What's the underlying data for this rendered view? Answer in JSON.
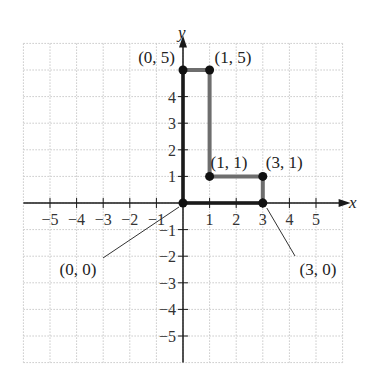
{
  "chart_data": {
    "type": "line",
    "title": "",
    "xlabel": "x",
    "ylabel": "y",
    "xlim": [
      -6,
      6
    ],
    "ylim": [
      -6,
      6
    ],
    "grid": true,
    "x_ticks": [
      -5,
      -4,
      -3,
      -2,
      -1,
      1,
      2,
      3,
      4,
      5
    ],
    "y_ticks": [
      -5,
      -4,
      -3,
      -2,
      -1,
      1,
      2,
      3,
      4
    ],
    "x_tick_labels": [
      "−5",
      "−4",
      "−3",
      "−2",
      "−1",
      "1",
      "2",
      "3",
      "4",
      "5"
    ],
    "y_tick_labels": [
      "−5",
      "−4",
      "−3",
      "−2",
      "−1",
      "1",
      "2",
      "3",
      "4"
    ],
    "series": [
      {
        "name": "L-shaped polygon",
        "x": [
          0,
          1,
          1,
          3,
          3,
          0,
          0
        ],
        "y": [
          5,
          5,
          1,
          1,
          0,
          0,
          5
        ]
      }
    ],
    "points": [
      {
        "x": 0,
        "y": 5,
        "label": "(0, 5)"
      },
      {
        "x": 1,
        "y": 5,
        "label": "(1, 5)"
      },
      {
        "x": 1,
        "y": 1,
        "label": "(1, 1)"
      },
      {
        "x": 3,
        "y": 1,
        "label": "(3, 1)"
      },
      {
        "x": 0,
        "y": 0,
        "label": "(0, 0)"
      },
      {
        "x": 3,
        "y": 0,
        "label": "(3, 0)"
      }
    ],
    "annotations": [
      "(0, 5)",
      "(1, 5)",
      "(1, 1)",
      "(3, 1)",
      "(0, 0)",
      "(3, 0)"
    ]
  },
  "axes": {
    "x_name": "x",
    "y_name": "y"
  },
  "colors": {
    "polygon": "#6e6e6e",
    "axis": "#1a1a1a",
    "grid": "#c8c8c8",
    "point": "#111111"
  }
}
